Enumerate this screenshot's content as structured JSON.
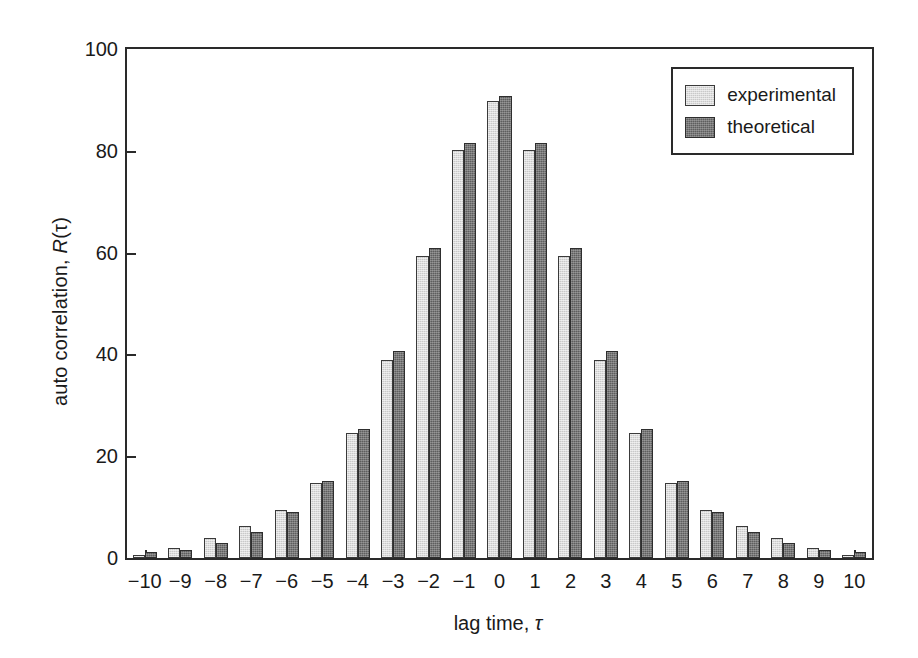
{
  "chart_data": {
    "type": "bar",
    "title": "",
    "subtitle": "",
    "xlabel": "lag time, τ",
    "ylabel": "auto correlation, R(τ)",
    "ylabel_prefix": "auto correlation, ",
    "ylabel_symbol": "R",
    "ylabel_suffix": "(τ)",
    "xlabel_prefix": "lag time, ",
    "xlabel_symbol": "τ",
    "categories": [
      "−10",
      "−9",
      "−8",
      "−7",
      "−6",
      "−5",
      "−4",
      "−3",
      "−2",
      "−1",
      "0",
      "1",
      "2",
      "3",
      "4",
      "5",
      "6",
      "7",
      "8",
      "9",
      "10"
    ],
    "x": [
      -10,
      -9,
      -8,
      -7,
      -6,
      -5,
      -4,
      -3,
      -2,
      -1,
      0,
      1,
      2,
      3,
      4,
      5,
      6,
      7,
      8,
      9,
      10
    ],
    "series": [
      {
        "name": "experimental",
        "color": "#c9c9c9",
        "values": [
          0.5,
          2.0,
          4.0,
          6.2,
          9.4,
          14.8,
          24.6,
          39.0,
          59.4,
          80.2,
          89.7,
          80.2,
          59.4,
          39.0,
          24.6,
          14.8,
          9.4,
          6.2,
          4.0,
          2.0,
          0.5
        ]
      },
      {
        "name": "theoretical",
        "color": "#5e5e5e",
        "values": [
          1.2,
          1.6,
          3.0,
          5.2,
          9.0,
          15.2,
          25.3,
          40.6,
          61.0,
          81.5,
          90.8,
          81.5,
          61.0,
          40.6,
          25.3,
          15.2,
          9.0,
          5.2,
          3.0,
          1.6,
          1.2
        ]
      }
    ],
    "ylim": [
      0,
      100
    ],
    "yticks": [
      0,
      20,
      40,
      60,
      80,
      100
    ],
    "ytick_labels": [
      "0",
      "20",
      "40",
      "60",
      "80",
      "100"
    ],
    "grid": false,
    "legend_position": "top-right",
    "legend_entries": [
      "experimental",
      "theoretical"
    ]
  },
  "legend": {
    "items": [
      {
        "label": "experimental",
        "swatch": "experimental-swatch"
      },
      {
        "label": "theoretical",
        "swatch": "theoretical-swatch"
      }
    ]
  }
}
